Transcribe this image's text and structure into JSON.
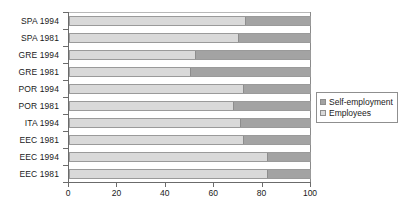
{
  "chart_data": {
    "type": "bar",
    "orientation": "horizontal",
    "stacked": true,
    "title": "",
    "subtitle": "",
    "xlabel": "",
    "ylabel": "",
    "xlim": [
      0,
      100
    ],
    "xticks": [
      0,
      20,
      40,
      60,
      80,
      100
    ],
    "xticklabels": [
      "0",
      "20",
      "40",
      "60",
      "80",
      "100"
    ],
    "grid": false,
    "legend_position": "right",
    "categories": [
      "SPA 1994",
      "SPA 1981",
      "GRE 1994",
      "GRE 1981",
      "POR 1994",
      "POR 1981",
      "ITA 1994",
      "EEC 1981",
      "EEC 1994",
      "EEC 1981"
    ],
    "series": [
      {
        "name": "Employees",
        "color": "#d9d9d9",
        "values": [
          73,
          70,
          52,
          50,
          72,
          68,
          71,
          72,
          82,
          82
        ]
      },
      {
        "name": "Self-employment",
        "color": "#a3a3a3",
        "values": [
          27,
          30,
          48,
          50,
          28,
          32,
          29,
          28,
          18,
          18
        ]
      }
    ],
    "legend_entries": [
      {
        "label": "Self-employment",
        "color": "#a3a3a3"
      },
      {
        "label": "Employees",
        "color": "#d9d9d9"
      }
    ]
  },
  "colors": {
    "self_employment": "#a3a3a3",
    "employees": "#d9d9d9",
    "axis": "#6b6b6b",
    "text": "#1a1a1a",
    "background": "#ffffff"
  }
}
